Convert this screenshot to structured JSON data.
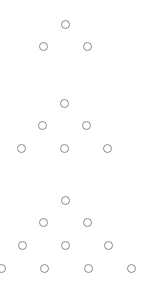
{
  "diagram": {
    "title": "",
    "type": "triangular-number-dot-patterns",
    "circle_style": {
      "stroke": "#8a8a8a",
      "fill": "none",
      "diameter": 9
    },
    "figures": [
      {
        "name": "figure-1",
        "rows": [
          1,
          2
        ],
        "circles": [
          [
            65,
            24
          ],
          [
            43,
            46
          ],
          [
            87,
            46
          ]
        ]
      },
      {
        "name": "figure-2",
        "rows": [
          1,
          2,
          3
        ],
        "circles": [
          [
            64,
            103
          ],
          [
            42,
            125
          ],
          [
            86,
            125
          ],
          [
            21,
            148
          ],
          [
            64,
            148
          ],
          [
            107,
            148
          ]
        ]
      },
      {
        "name": "figure-3",
        "rows": [
          1,
          2,
          3,
          4
        ],
        "circles": [
          [
            65,
            200
          ],
          [
            43,
            222
          ],
          [
            87,
            222
          ],
          [
            22,
            245
          ],
          [
            65,
            245
          ],
          [
            108,
            245
          ],
          [
            1,
            268
          ],
          [
            44,
            268
          ],
          [
            88,
            268
          ],
          [
            131,
            268
          ]
        ]
      }
    ]
  }
}
